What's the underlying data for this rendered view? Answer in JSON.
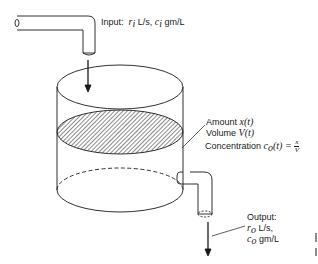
{
  "diagram": {
    "type": "mixing-tank",
    "input_label": {
      "prefix": "Input:",
      "rate_symbol": "r",
      "rate_sub": "i",
      "rate_unit": "L/s,",
      "conc_symbol": "c",
      "conc_sub": "i",
      "conc_unit": "gm/L"
    },
    "tank_labels": {
      "amount_prefix": "Amount",
      "amount_symbol": "x(t)",
      "volume_prefix": "Volume",
      "volume_symbol": "V(t)",
      "concentration_prefix": "Concentration",
      "concentration_symbol": "c",
      "concentration_sub": "o",
      "concentration_arg": "(t) =",
      "fraction_num": "x",
      "fraction_den": "V"
    },
    "output_label": {
      "title": "Output:",
      "rate_symbol": "r",
      "rate_sub": "o",
      "rate_unit": "L/s,",
      "conc_symbol": "c",
      "conc_sub": "o",
      "conc_unit": "gm/L"
    },
    "colors": {
      "stroke": "#1a1a1a",
      "background": "#ffffff"
    }
  }
}
